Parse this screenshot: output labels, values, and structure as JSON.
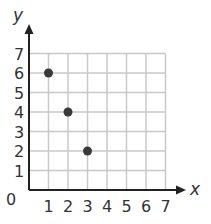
{
  "chart_data": {
    "type": "scatter",
    "title": "",
    "xlabel": "x",
    "ylabel": "y",
    "xlim": [
      0,
      7
    ],
    "ylim": [
      0,
      7
    ],
    "grid": true,
    "x_ticks": [
      "1",
      "2",
      "3",
      "4",
      "5",
      "6",
      "7"
    ],
    "y_ticks": [
      "1",
      "2",
      "3",
      "4",
      "5",
      "6",
      "7"
    ],
    "origin_label": "0",
    "points": [
      {
        "x": 1,
        "y": 6
      },
      {
        "x": 2,
        "y": 4
      },
      {
        "x": 3,
        "y": 2
      }
    ]
  },
  "colors": {
    "grid": "#c8c8c8",
    "axis": "#222222",
    "point": "#3a3a3a",
    "text": "#333333"
  }
}
